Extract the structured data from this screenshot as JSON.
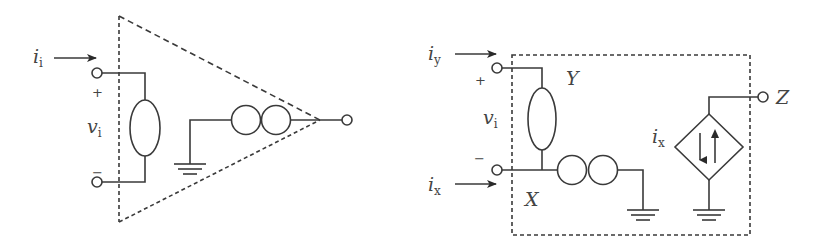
{
  "diagrams": {
    "left": {
      "title": "Opamp-style two-port (voltage-mode) model",
      "input_current": {
        "symbol": "i",
        "subscript": "i"
      },
      "input_voltage": {
        "symbol": "v",
        "subscript": "i"
      },
      "plus_sign": "+",
      "minus_sign": "−",
      "elements": [
        "nullator",
        "norator",
        "ground",
        "output-terminal"
      ]
    },
    "right": {
      "title": "Current conveyor model",
      "current_y": {
        "symbol": "i",
        "subscript": "y"
      },
      "current_x": {
        "symbol": "i",
        "subscript": "x"
      },
      "input_voltage": {
        "symbol": "v",
        "subscript": "i"
      },
      "plus_sign": "+",
      "minus_sign": "−",
      "node_y": "Y",
      "node_x": "X",
      "node_z": "Z",
      "controlled_source_label": {
        "symbol": "i",
        "subscript": "x"
      },
      "elements": [
        "nullator",
        "norator",
        "ground",
        "dependent-current-source",
        "ground"
      ]
    }
  },
  "colors": {
    "stroke": "#3a3a3a",
    "text": "#444444",
    "background": "#ffffff"
  }
}
